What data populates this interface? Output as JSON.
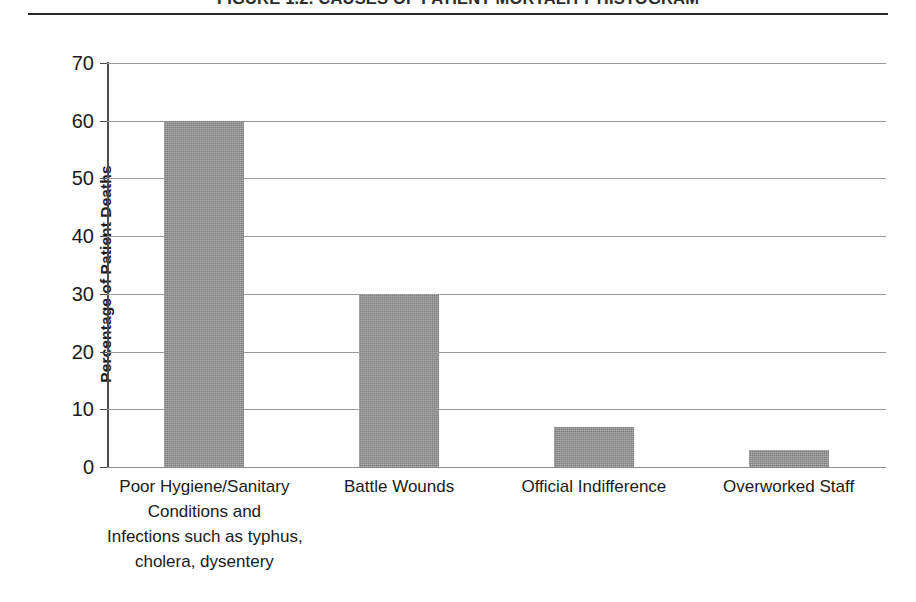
{
  "figure": {
    "title": "FIGURE 1.2. CAUSES OF PATIENT MORTALITY HISTOGRAM",
    "rule": "horizontal-rule"
  },
  "chart_data": {
    "type": "bar",
    "title": "FIGURE 1.2. CAUSES OF PATIENT MORTALITY HISTOGRAM",
    "xlabel": "",
    "ylabel": "Percentage of Patient Deaths",
    "ylim": [
      0,
      70
    ],
    "ytick_step": 10,
    "yticks": [
      0,
      10,
      20,
      30,
      40,
      50,
      60,
      70
    ],
    "ytick_labels": [
      "0",
      "10",
      "20",
      "30",
      "40",
      "50",
      "60",
      "70"
    ],
    "grid": "horizontal",
    "legend": "none",
    "bar_color": "#8e8e8e",
    "categories": [
      "Poor Hygiene/Sanitary Conditions and Infections such as typhus, cholera, dysentery",
      "Battle Wounds",
      "Official Indifference",
      "Overworked Staff"
    ],
    "category_label_lines": [
      [
        "Poor Hygiene/Sanitary",
        "Conditions and",
        "Infections such as typhus,",
        "cholera, dysentery"
      ],
      [
        "Battle Wounds"
      ],
      [
        "Official Indifference"
      ],
      [
        "Overworked Staff"
      ]
    ],
    "values": [
      60,
      30,
      7,
      3
    ]
  }
}
